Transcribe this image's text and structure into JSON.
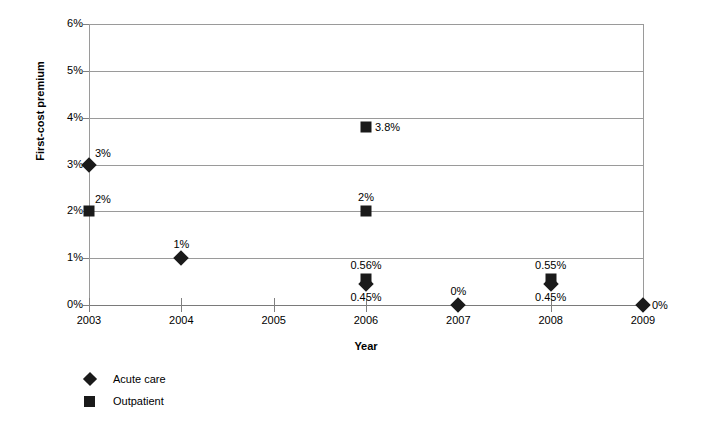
{
  "chart_data": {
    "type": "scatter",
    "title": "",
    "xlabel": "Year",
    "ylabel": "First-cost premium",
    "x": [
      2003,
      2004,
      2005,
      2006,
      2007,
      2008,
      2009
    ],
    "xtick_labels": [
      "2003",
      "2004",
      "2005",
      "2006",
      "2007",
      "2008",
      "2009"
    ],
    "ytick_labels": [
      "0%",
      "1%",
      "2%",
      "3%",
      "4%",
      "5%",
      "6%"
    ],
    "ytick_values": [
      0,
      1,
      2,
      3,
      4,
      5,
      6
    ],
    "ylim": [
      0,
      6
    ],
    "xlim": [
      2003,
      2009
    ],
    "grid": true,
    "legend_position": "below-left",
    "series": [
      {
        "name": "Acute care",
        "marker": "diamond",
        "color": "#1a1a1a",
        "points": [
          {
            "x": 2003,
            "y": 3,
            "label": "3%",
            "label_pos": "right-above"
          },
          {
            "x": 2004,
            "y": 1,
            "label": "1%",
            "label_pos": "above"
          },
          {
            "x": 2006,
            "y": 0.45,
            "label": "0.45%",
            "label_pos": "below"
          },
          {
            "x": 2007,
            "y": 0,
            "label": "0%",
            "label_pos": "above"
          },
          {
            "x": 2008,
            "y": 0.45,
            "label": "0.45%",
            "label_pos": "below"
          },
          {
            "x": 2009,
            "y": 0,
            "label": "0%",
            "label_pos": "right"
          }
        ]
      },
      {
        "name": "Outpatient",
        "marker": "square",
        "color": "#1a1a1a",
        "points": [
          {
            "x": 2003,
            "y": 2,
            "label": "2%",
            "label_pos": "right-above"
          },
          {
            "x": 2006,
            "y": 3.8,
            "label": "3.8%",
            "label_pos": "right"
          },
          {
            "x": 2006,
            "y": 2,
            "label": "2%",
            "label_pos": "above"
          },
          {
            "x": 2006,
            "y": 0.56,
            "label": "0.56%",
            "label_pos": "above"
          },
          {
            "x": 2008,
            "y": 0.55,
            "label": "0.55%",
            "label_pos": "above"
          }
        ]
      }
    ]
  },
  "axes": {
    "y_title": "First-cost premium",
    "x_title": "Year",
    "y_ticks": [
      {
        "label": "6%",
        "value": 6
      },
      {
        "label": "5%",
        "value": 5
      },
      {
        "label": "4%",
        "value": 4
      },
      {
        "label": "3%",
        "value": 3
      },
      {
        "label": "2%",
        "value": 2
      },
      {
        "label": "1%",
        "value": 1
      },
      {
        "label": "0%",
        "value": 0
      }
    ],
    "x_ticks": [
      {
        "label": "2003",
        "value": 2003
      },
      {
        "label": "2004",
        "value": 2004
      },
      {
        "label": "2005",
        "value": 2005
      },
      {
        "label": "2006",
        "value": 2006
      },
      {
        "label": "2007",
        "value": 2007
      },
      {
        "label": "2008",
        "value": 2008
      },
      {
        "label": "2009",
        "value": 2009
      }
    ]
  },
  "legend": {
    "items": [
      {
        "label": "Acute care",
        "marker": "diamond",
        "icon": "diamond-marker-icon"
      },
      {
        "label": "Outpatient",
        "marker": "square",
        "icon": "square-marker-icon"
      }
    ]
  },
  "colors": {
    "marker": "#1a1a1a",
    "gridline": "#9a9a9a",
    "text": "#000000",
    "background": "#ffffff"
  }
}
